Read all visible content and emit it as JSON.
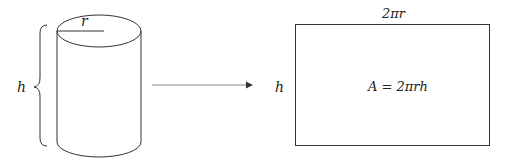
{
  "diagram": {
    "cylinder": {
      "radius_label": "r",
      "height_label": "h"
    },
    "rectangle": {
      "width_label": "2πr",
      "height_label": "h",
      "area_label": "A = 2πrh"
    },
    "colors": {
      "stroke": "#333333",
      "arrow": "#888888",
      "background": "#ffffff"
    }
  }
}
